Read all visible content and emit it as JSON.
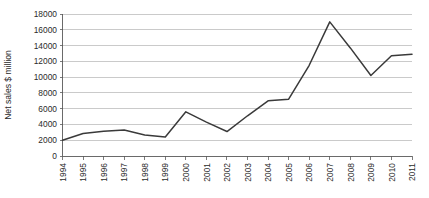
{
  "chart_data": {
    "type": "line",
    "title": "",
    "xlabel": "",
    "ylabel": "Net sales $ million",
    "categories": [
      "1994",
      "1995",
      "1996",
      "1997",
      "1998",
      "1999",
      "2000",
      "2001",
      "2002",
      "2003",
      "2004",
      "2005",
      "2006",
      "2007",
      "2008",
      "2009",
      "2010",
      "2011"
    ],
    "x": [
      1994,
      1995,
      1996,
      1997,
      1998,
      1999,
      2000,
      2001,
      2002,
      2003,
      2004,
      2005,
      2006,
      2007,
      2008,
      2009,
      2010,
      2011
    ],
    "values": [
      2000,
      2850,
      3150,
      3300,
      2650,
      2400,
      5600,
      4300,
      3100,
      5100,
      7000,
      7200,
      11500,
      17000,
      13700,
      10200,
      12700,
      12900
    ],
    "series": [
      {
        "name": "Net sales",
        "values": [
          2000,
          2850,
          3150,
          3300,
          2650,
          2400,
          5600,
          4300,
          3100,
          5100,
          7000,
          7200,
          11500,
          17000,
          13700,
          10200,
          12700,
          12900
        ]
      }
    ],
    "ylim": [
      0,
      18000
    ],
    "ytick_values": [
      0,
      2000,
      4000,
      6000,
      8000,
      10000,
      12000,
      14000,
      16000,
      18000
    ],
    "ytick_labels": [
      "0",
      "2000",
      "4000",
      "6000",
      "8000",
      "10000",
      "12000",
      "14000",
      "16000",
      "18000"
    ],
    "xtick_labels": [
      "1994",
      "1995",
      "1996",
      "1997",
      "1998",
      "1999",
      "2000",
      "2001",
      "2002",
      "2003",
      "2004",
      "2005",
      "2006",
      "2007",
      "2008",
      "2009",
      "2010",
      "2011"
    ],
    "grid": true,
    "grid_axis": "y",
    "legend": false,
    "legend_position": "none",
    "markers": false,
    "line_color": "#3a3a3a",
    "grid_color": "#b4b4b4",
    "axis_color": "#5a5a5a",
    "background_color": "#ffffff",
    "xtick_label_rotation": -90
  }
}
